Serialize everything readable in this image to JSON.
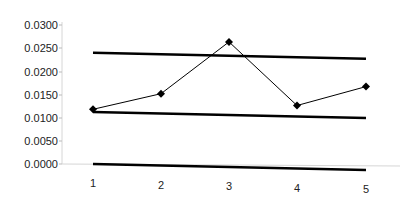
{
  "chart_data": {
    "type": "line",
    "title": "",
    "xlabel": "",
    "ylabel": "",
    "categories": [
      "1",
      "2",
      "3",
      "4",
      "5"
    ],
    "x": [
      1,
      2,
      3,
      4,
      5
    ],
    "series": [
      {
        "name": "Data",
        "values": [
          0.0118,
          0.0155,
          0.027,
          0.0136,
          0.018
        ],
        "marker": "diamond",
        "color": "#000000",
        "line_width": 1
      },
      {
        "name": "Upper control line",
        "values": [
          0.024,
          0.024,
          0.024,
          0.024,
          0.024
        ],
        "marker": "none",
        "color": "#000000",
        "line_width": 2.5
      },
      {
        "name": "Lower control line",
        "values": [
          0.0112,
          0.0112,
          0.0112,
          0.0112,
          0.0112
        ],
        "marker": "none",
        "color": "#000000",
        "line_width": 2.5
      },
      {
        "name": "Zero line",
        "values": [
          0.0,
          0.0,
          0.0,
          0.0,
          0.0
        ],
        "marker": "none",
        "color": "#000000",
        "line_width": 2.5
      }
    ],
    "ylim": [
      0,
      0.03
    ],
    "yticks": [
      "0.0300",
      "0.0250",
      "0.0200",
      "0.0150",
      "0.0100",
      "0.0050",
      "0.0000"
    ],
    "xticks": [
      "1",
      "2",
      "3",
      "4",
      "5"
    ],
    "grid": false,
    "legend": "none"
  }
}
